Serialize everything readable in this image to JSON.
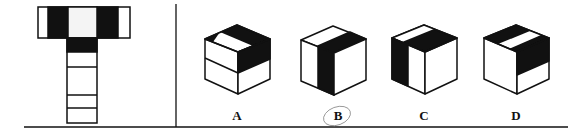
{
  "puzzle": {
    "type": "cube net folding",
    "net": {
      "description": "T-shaped cube net with black bands",
      "faces": [
        "top-row-left",
        "top-row-center",
        "top-row-right",
        "stem-1",
        "stem-2",
        "stem-3"
      ]
    },
    "options": [
      {
        "label": "A"
      },
      {
        "label": "B",
        "circled": true
      },
      {
        "label": "C"
      },
      {
        "label": "D"
      }
    ]
  },
  "colors": {
    "ink": "#111111",
    "paper": "#ffffff",
    "circle": "#999999"
  }
}
